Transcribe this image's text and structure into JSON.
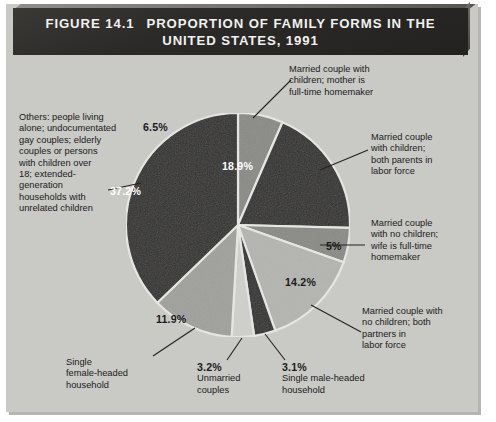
{
  "figure": {
    "number": "FIGURE 14.1",
    "title_line1": "PROPORTION OF FAMILY FORMS IN THE",
    "title_line2": "UNITED STATES, 1991"
  },
  "colors": {
    "plate_background": "#c9c9c6",
    "header_background": "#2c2b29",
    "header_text": "#f2f1ee",
    "slice_dark": "#323130",
    "slice_medium": "#8a8a87",
    "slice_light": "#b4b4b1",
    "slice_pale": "#cfcfcc",
    "label_text": "#1b1b1b"
  },
  "chart_data": {
    "type": "pie",
    "title": "PROPORTION OF FAMILY FORMS IN THE UNITED STATES, 1991",
    "xlabel": "",
    "ylabel": "",
    "legend_position": "callout-labels",
    "grid": false,
    "categories": [
      "Married couple with children; mother is full-time homemaker",
      "Married couple with children; both parents in labor force",
      "Married couple with no children; wife is full-time homemaker",
      "Married couple with no children; both partners in labor force",
      "Single male-headed household",
      "Unmarried couples",
      "Single female-headed household",
      "Others: people living alone; undocumentated gay couples; elderly couples or persons with children over 18; extended-generation households with unrelated children"
    ],
    "values": [
      6.5,
      18.9,
      5,
      14.2,
      3.1,
      3.2,
      11.9,
      37.2
    ],
    "value_labels": [
      "6.5%",
      "18.9%",
      "5%",
      "14.2%",
      "3.1%",
      "3.2%",
      "11.9%",
      "37.2%"
    ],
    "slice_colors": [
      "#8a8a87",
      "#323130",
      "#8a8a87",
      "#b4b4b1",
      "#323130",
      "#cfcfcc",
      "#a0a09d",
      "#323130"
    ],
    "start_angle_deg": 0,
    "direction": "clockwise",
    "total": 100
  },
  "callouts": [
    {
      "id": "married-children-homemaker",
      "lines": [
        "Married couple with",
        "children; mother is",
        "full-time homemaker"
      ],
      "percent": "6.5%"
    },
    {
      "id": "married-children-both-labor",
      "lines": [
        "Married couple",
        "with children;",
        "both parents in",
        "labor force"
      ],
      "percent": "18.9%"
    },
    {
      "id": "married-nochildren-wife-homemaker",
      "lines": [
        "Married couple",
        "with no children;",
        "wife is full-time",
        "homemaker"
      ],
      "percent": "5%"
    },
    {
      "id": "married-nochildren-both-labor",
      "lines": [
        "Married couple with",
        "no children; both",
        "partners in",
        "labor force"
      ],
      "percent": "14.2%"
    },
    {
      "id": "single-male-headed",
      "lines": [
        "Single male-headed",
        "household"
      ],
      "percent": "3.1%"
    },
    {
      "id": "unmarried-couples",
      "lines": [
        "Unmarried",
        "couples"
      ],
      "percent": "3.2%"
    },
    {
      "id": "single-female-headed",
      "lines": [
        "Single",
        "female-headed",
        "household"
      ],
      "percent": "11.9%"
    },
    {
      "id": "others",
      "lines": [
        "Others: people living",
        "alone; undocumentated",
        "gay couples; elderly",
        "couples or persons",
        "with children over",
        "18; extended-",
        "generation",
        "households with",
        "unrelated children"
      ],
      "percent": "37.2%"
    }
  ]
}
